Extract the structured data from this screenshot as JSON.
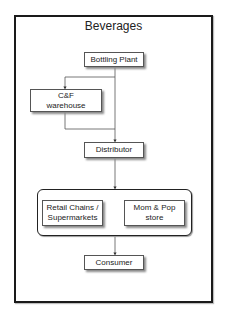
{
  "diagram": {
    "title": "Beverages",
    "nodes": {
      "bottling_plant": "Bottling Plant",
      "cf_warehouse": "C&F\nwarehouse",
      "distributor": "Distributor",
      "retail_chains": "Retail Chains /\nSupermarkets",
      "mom_pop": "Mom & Pop\nstore",
      "consumer": "Consumer"
    },
    "edges": [
      {
        "from": "Bottling Plant",
        "to": "C&F warehouse"
      },
      {
        "from": "Bottling Plant",
        "to": "Distributor"
      },
      {
        "from": "C&F warehouse",
        "to": "Distributor"
      },
      {
        "from": "Distributor",
        "to": "Retail Chains / Supermarkets + Mom & Pop store"
      },
      {
        "from": "Retail Chains / Supermarkets + Mom & Pop store",
        "to": "Consumer"
      }
    ],
    "colors": {
      "frame": "#1a1a1a",
      "node_border": "#555555",
      "edge": "#444444",
      "shadow": "#8a8a8a"
    }
  }
}
